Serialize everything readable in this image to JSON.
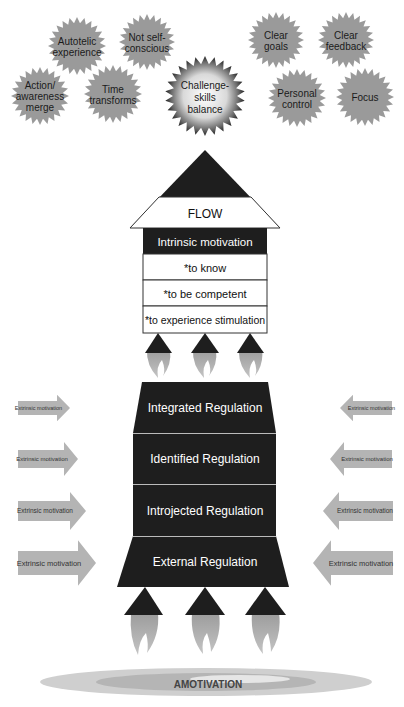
{
  "colors": {
    "badge_fill": "#9a9a9a",
    "rocket_dark": "#1e1e1e",
    "arrow_fill": "#b4b4b4",
    "flame_fill": "#a8a8a8",
    "box_border": "#333333"
  },
  "badges": [
    {
      "id": "autotelic",
      "lines": [
        "Autotelic",
        "experience"
      ],
      "cx": 77,
      "cy": 46,
      "r": 29
    },
    {
      "id": "not-self-conscious",
      "lines": [
        "Not self-",
        "conscious"
      ],
      "cx": 147,
      "cy": 42,
      "r": 28
    },
    {
      "id": "clear-goals",
      "lines": [
        "Clear",
        "goals"
      ],
      "cx": 276,
      "cy": 40,
      "r": 28
    },
    {
      "id": "clear-feedback",
      "lines": [
        "Clear",
        "feedback"
      ],
      "cx": 346,
      "cy": 40,
      "r": 28
    },
    {
      "id": "action-awareness",
      "lines": [
        "Action/",
        "awareness",
        "merge"
      ],
      "cx": 40,
      "cy": 96,
      "r": 29
    },
    {
      "id": "time-transforms",
      "lines": [
        "Time",
        "transforms"
      ],
      "cx": 113,
      "cy": 94,
      "r": 29
    },
    {
      "id": "personal-control",
      "lines": [
        "Personal",
        "control"
      ],
      "cx": 297,
      "cy": 98,
      "r": 29
    },
    {
      "id": "focus",
      "lines": [
        "Focus"
      ],
      "cx": 365,
      "cy": 97,
      "r": 29
    }
  ],
  "center_badge": {
    "lines": [
      "Challenge-",
      "skills",
      "balance"
    ],
    "cx": 205,
    "cy": 96,
    "r": 40
  },
  "flow_label": "FLOW",
  "intrinsic": {
    "header": "Intrinsic motivation",
    "items": [
      "*to know",
      "*to be competent",
      "*to experience stimulation"
    ]
  },
  "regulations": [
    "Integrated Regulation",
    "Identified Regulation",
    "Introjected Regulation",
    "External Regulation"
  ],
  "extrinsic_label": "Extrinsic motivation",
  "amotivation_label": "AMOTIVATION"
}
